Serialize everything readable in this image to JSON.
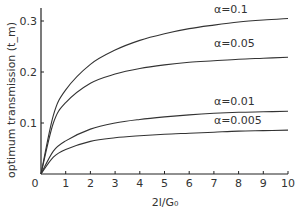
{
  "chart_data": {
    "type": "line",
    "title": "",
    "xlabel": "2l/G₀",
    "ylabel": "optimum transmission (t_m)",
    "xlim": [
      0,
      10
    ],
    "ylim": [
      0,
      0.32
    ],
    "x_ticks": [
      0,
      1,
      2,
      3,
      4,
      5,
      6,
      7,
      8,
      9,
      10
    ],
    "y_ticks": [
      0.1,
      0.2,
      0.3
    ],
    "y_tick_labels": [
      "0.1",
      "0.2",
      "0.3"
    ],
    "grid": false,
    "legend": "inline labels above curves",
    "x": [
      0,
      0.5,
      1,
      2,
      3,
      4,
      5,
      6,
      7,
      8,
      9,
      10
    ],
    "series": [
      {
        "name": "α=0.1",
        "values": [
          0,
          0.115,
          0.165,
          0.215,
          0.243,
          0.262,
          0.275,
          0.285,
          0.292,
          0.298,
          0.302,
          0.305
        ]
      },
      {
        "name": "α=0.05",
        "values": [
          0,
          0.1,
          0.14,
          0.178,
          0.196,
          0.207,
          0.214,
          0.219,
          0.222,
          0.225,
          0.227,
          0.229
        ]
      },
      {
        "name": "α=0.01",
        "values": [
          0,
          0.045,
          0.065,
          0.088,
          0.1,
          0.107,
          0.112,
          0.116,
          0.119,
          0.121,
          0.122,
          0.123
        ]
      },
      {
        "name": "α=0.005",
        "values": [
          0,
          0.033,
          0.048,
          0.064,
          0.071,
          0.075,
          0.078,
          0.08,
          0.082,
          0.084,
          0.085,
          0.086
        ]
      }
    ],
    "label_positions": [
      {
        "x": 7.0,
        "y": 0.315
      },
      {
        "x": 7.0,
        "y": 0.25
      },
      {
        "x": 7.0,
        "y": 0.135
      },
      {
        "x": 7.0,
        "y": 0.098
      }
    ]
  }
}
